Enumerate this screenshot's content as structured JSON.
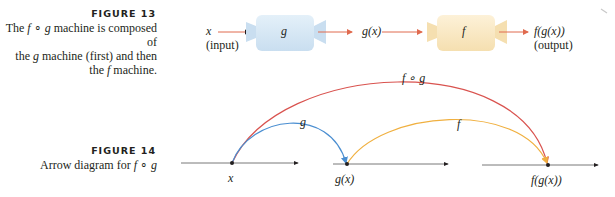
{
  "figure13": {
    "title": "FIGURE 13",
    "caption_parts": [
      "The ",
      "f",
      " ∘ ",
      "g",
      " machine is composed of",
      "the ",
      "g",
      " machine (first) and then",
      "the ",
      "f",
      " machine."
    ],
    "input_var": "x",
    "input_label": "(input)",
    "machine_g_label": "g",
    "intermediate_label": "g(x)",
    "machine_f_label": "f",
    "output_expr": "f(g(x))",
    "output_label": "(output)",
    "colors": {
      "machine_g_fill": "#d6e8f5",
      "machine_f_fill": "#faeac6",
      "arrow": "#e06a4e"
    }
  },
  "figure14": {
    "title": "FIGURE 14",
    "caption_prefix": "Arrow diagram for ",
    "caption_f": "f",
    "caption_op": " ∘ ",
    "caption_g": "g",
    "arc_labels": {
      "composite": "f ∘ g",
      "g": "g",
      "f": "f"
    },
    "point_labels": {
      "x": "x",
      "gx": "g(x)",
      "fgx": "f(g(x))"
    },
    "colors": {
      "composite_arc": "#d9534f",
      "g_arc": "#4a8ed1",
      "f_arc": "#f0b040",
      "axis": "#231f20"
    }
  }
}
